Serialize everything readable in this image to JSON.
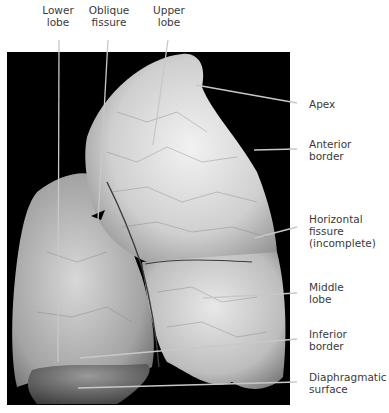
{
  "figure": {
    "labels": {
      "lower_lobe": [
        "Lower",
        "lobe"
      ],
      "oblique_fissure": [
        "Oblique",
        "fissure"
      ],
      "upper_lobe": [
        "Upper",
        "lobe"
      ],
      "apex": [
        "Apex"
      ],
      "anterior_border": [
        "Anterior",
        "border"
      ],
      "horizontal_fissure": [
        "Horizontal",
        "fissure",
        "(incomplete)"
      ],
      "middle_lobe": [
        "Middle",
        "lobe"
      ],
      "inferior_border": [
        "Inferior",
        "border"
      ],
      "diaphragmatic_surface": [
        "Diaphragmatic",
        "surface"
      ]
    },
    "colors": {
      "background": "#ffffff",
      "photo_background": "#000000",
      "label_text": "#3a3a3a",
      "leader_line": "#c8c8c8"
    }
  }
}
